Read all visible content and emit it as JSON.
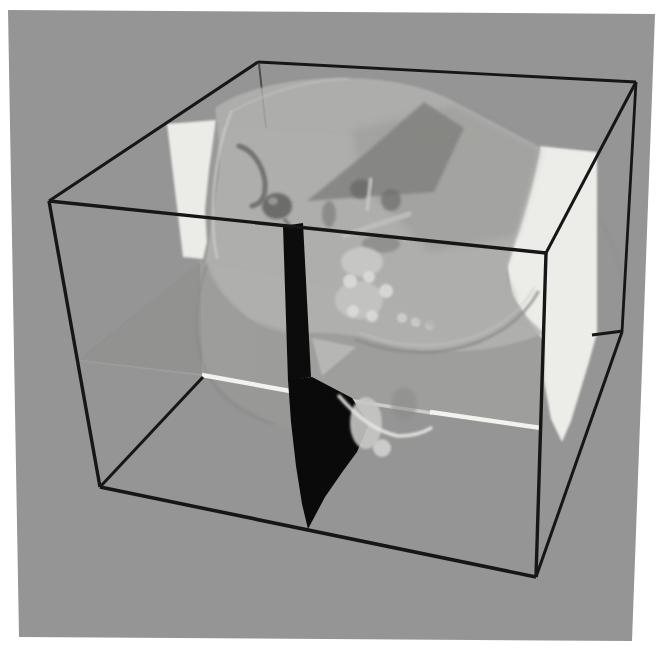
{
  "colors": {
    "page_bg": "#ffffff",
    "panel_bg": "#959595",
    "wireframe": "#161616",
    "sagittal_black": "#0b0b0b",
    "plane_white": "#efefeb",
    "axial_sliver": "#f5f5f1",
    "skull_light": "#b3b3b1"
  },
  "panel": {
    "points": "8,10 655,14 632,641 19,637"
  },
  "figure": {
    "width": 672,
    "height": 661,
    "filters": [
      {
        "id": "f1",
        "std": 0.8
      },
      {
        "id": "f2",
        "std": 1.8
      },
      {
        "id": "f3",
        "std": 3.5
      }
    ],
    "elements": [
      {
        "kind": "line",
        "name": "box-edge-back-left-occluded",
        "x1": 259,
        "y1": 64,
        "x2": 266,
        "y2": 128,
        "stroke": "#3f3f3d",
        "sw": 2,
        "op": 0.85
      },
      {
        "kind": "polygon",
        "name": "coronal-plane-backdrop-tint",
        "points": "170,122 596,150 596,332 546,330 200,261",
        "fill": "#ffffff",
        "op": 0.05,
        "blur": "f3"
      },
      {
        "kind": "line",
        "name": "coronal-plane-top-edge",
        "x1": 170,
        "y1": 121,
        "x2": 596,
        "y2": 150,
        "stroke": "#878785",
        "sw": 1.3,
        "op": 0.5
      },
      {
        "kind": "polygon",
        "name": "axial-plane-surface",
        "points": "79,361 202,376 540,428 546,331 200,261",
        "fill": "#9e9e9c",
        "op": 0.9
      },
      {
        "kind": "polygon",
        "name": "axial-plane-left-wing",
        "points": "80,360 200,263 202,374",
        "fill": "#888886",
        "op": 0.55
      },
      {
        "kind": "line",
        "name": "axial-plane-left-edge",
        "x1": 81,
        "y1": 359,
        "x2": 199,
        "y2": 263,
        "stroke": "#8a8a88",
        "sw": 1.4,
        "op": 0.55
      },
      {
        "kind": "polygon",
        "name": "coronal-plane-left-patch",
        "points": "167,124 216,120 209,170 205,210 207,242 203,259 183,257",
        "fill": "#eeeeea",
        "op": 0.97,
        "blur": "f1"
      },
      {
        "kind": "polygon",
        "name": "coronal-plane-right-patch",
        "points": "540,146 597,152 597,333 589,362 571,421 562,442 551,419 544,381 544,341 527,319 512,296 507,266 517,229 530,186",
        "fill": "#efefeb",
        "op": 0.97,
        "blur": "f1"
      },
      {
        "kind": "path",
        "name": "skull-back-silhouette",
        "d": "M600,218 Q618,250 626,292",
        "stroke": "#8a8a88",
        "sw": 2,
        "op": 0.35,
        "blur": "f2"
      },
      {
        "kind": "path",
        "name": "skull-dome",
        "d": "M215,108 C243,87 297,77 348,78 C398,79 431,89 455,102 L540,147 C535,183 522,224 508,266 C505,284 514,301 529,319 L544,333 C517,346 473,353 434,351 C401,350 379,343 361,337 C331,331 305,333 287,333 C261,330 239,314 223,295 C209,277 204,266 206,259 C210,235 215,203 219,173 C221,153 217,124 215,108 Z",
        "fill": "#b3b3b1",
        "op": 0.82,
        "blur": "f1"
      },
      {
        "kind": "polygon",
        "name": "skull-bowl-region",
        "points": "206,262 196,300 198,340 212,378 238,404 272,423 295,430 295,333 250,320 222,292",
        "fill": "#9b9b99",
        "op": 0.5,
        "blur": "f2"
      },
      {
        "kind": "path",
        "name": "skull-bowl-rim",
        "d": "M207,265 C194,300 193,340 206,372 C218,397 245,415 273,424",
        "stroke": "#848482",
        "sw": 2,
        "op": 0.5,
        "blur": "f1"
      },
      {
        "kind": "polygon",
        "name": "skull-inner-shade",
        "points": "352,130 455,106 540,150 516,235 430,252 362,182",
        "fill": "#9e9e9c",
        "op": 0.7,
        "blur": "f3"
      },
      {
        "kind": "polygon",
        "name": "sagittal-cut-wedge",
        "points": "424,102 464,128 434,192 307,201 366,153",
        "fill": "#7f7f7d",
        "op": 0.8,
        "blur": "f2"
      },
      {
        "kind": "path",
        "name": "left-temporal-arc",
        "d": "M239,146 C253,150 263,166 265,182 C266,196 261,204 252,206",
        "stroke": "#666664",
        "sw": 5,
        "op": 0.8,
        "blur": "f1"
      },
      {
        "kind": "ellipse",
        "name": "left-eye-socket",
        "cx": 277,
        "cy": 206,
        "rx": 15,
        "ry": 13,
        "fill": "#5c5c5a",
        "op": 0.8,
        "blur": "f2"
      },
      {
        "kind": "ellipse",
        "name": "left-eye-socket-inner",
        "cx": 273,
        "cy": 201,
        "rx": 5,
        "ry": 4,
        "fill": "#9a9a98",
        "op": 0.9,
        "blur": "f1"
      },
      {
        "kind": "path",
        "name": "orbit-hook",
        "d": "M285,220 Q292,228 294,236",
        "stroke": "#6a6a68",
        "sw": 4,
        "op": 0.7,
        "blur": "f1"
      },
      {
        "kind": "ellipse",
        "name": "nasal-cavity",
        "cx": 329,
        "cy": 214,
        "rx": 7,
        "ry": 13,
        "fill": "#7a7a78",
        "op": 0.65,
        "blur": "f2"
      },
      {
        "kind": "ellipse",
        "name": "right-eye-socket",
        "cx": 361,
        "cy": 189,
        "rx": 11,
        "ry": 10,
        "fill": "#6b6b69",
        "op": 0.8,
        "blur": "f2"
      },
      {
        "kind": "ellipse",
        "name": "right-orbit-recess",
        "cx": 391,
        "cy": 200,
        "rx": 10,
        "ry": 11,
        "fill": "#6f6f6d",
        "op": 0.75,
        "blur": "f2"
      },
      {
        "kind": "line",
        "name": "orbit-bright-streak",
        "x1": 371,
        "y1": 178,
        "x2": 367,
        "y2": 211,
        "stroke": "#c6c6c4",
        "sw": 4,
        "op": 0.85,
        "blur": "f1"
      },
      {
        "kind": "path",
        "name": "cheekbone-ridge",
        "d": "M344,236 Q378,224 409,214",
        "stroke": "#c0c0be",
        "sw": 5,
        "op": 0.85,
        "blur": "f1"
      },
      {
        "kind": "ellipse",
        "name": "under-cheek-shadow",
        "cx": 381,
        "cy": 244,
        "rx": 19,
        "ry": 9,
        "fill": "#7e7e7c",
        "op": 0.6,
        "blur": "f2"
      },
      {
        "kind": "ellipse",
        "name": "maxilla-mass",
        "cx": 362,
        "cy": 262,
        "rx": 21,
        "ry": 15,
        "fill": "#c9c9c7",
        "op": 0.9,
        "blur": "f2"
      },
      {
        "kind": "ellipse",
        "name": "mandible-mass",
        "cx": 359,
        "cy": 300,
        "rx": 24,
        "ry": 19,
        "fill": "#c5c5c3",
        "op": 0.9,
        "blur": "f2"
      },
      {
        "kind": "circle",
        "name": "tooth-knob-1",
        "cx": 350,
        "cy": 281,
        "r": 7,
        "fill": "#dbdbd9",
        "op": 0.9,
        "blur": "f1"
      },
      {
        "kind": "circle",
        "name": "tooth-knob-2",
        "cx": 369,
        "cy": 277,
        "r": 6,
        "fill": "#dbdbd9",
        "op": 0.9,
        "blur": "f1"
      },
      {
        "kind": "circle",
        "name": "tooth-knob-3",
        "cx": 386,
        "cy": 291,
        "r": 7,
        "fill": "#dbdbd9",
        "op": 0.9,
        "blur": "f1"
      },
      {
        "kind": "circle",
        "name": "tooth-knob-4",
        "cx": 353,
        "cy": 311,
        "r": 6,
        "fill": "#dbdbd9",
        "op": 0.9,
        "blur": "f1"
      },
      {
        "kind": "circle",
        "name": "tooth-knob-5",
        "cx": 372,
        "cy": 316,
        "r": 6,
        "fill": "#dbdbd9",
        "op": 0.9,
        "blur": "f1"
      },
      {
        "kind": "circle",
        "name": "molar-1",
        "cx": 402,
        "cy": 318,
        "r": 5,
        "fill": "#d4d4d2",
        "op": 0.8,
        "blur": "f1"
      },
      {
        "kind": "circle",
        "name": "molar-2",
        "cx": 416,
        "cy": 322,
        "r": 5,
        "fill": "#d4d4d2",
        "op": 0.8,
        "blur": "f1"
      },
      {
        "kind": "circle",
        "name": "molar-3",
        "cx": 430,
        "cy": 325,
        "r": 5,
        "fill": "#d4d4d2",
        "op": 0.8,
        "blur": "f1"
      },
      {
        "kind": "ellipse",
        "name": "jaw-mass",
        "cx": 462,
        "cy": 300,
        "rx": 52,
        "ry": 36,
        "fill": "#aeaeac",
        "op": 0.8,
        "blur": "f3"
      },
      {
        "kind": "path",
        "name": "jaw-arc-shadow",
        "d": "M356,340 Q420,364 478,342 Q520,325 538,292",
        "stroke": "#8b8b89",
        "sw": 3,
        "op": 0.75,
        "blur": "f1"
      },
      {
        "kind": "path",
        "name": "jaw-arc-highlight",
        "d": "M360,333 Q420,356 476,336 Q516,320 534,288",
        "stroke": "#c4c4c2",
        "sw": 2,
        "op": 0.55,
        "blur": "f1"
      },
      {
        "kind": "path",
        "name": "skull-rim-highlight-left",
        "d": "M217,258 C209,220 212,160 231,112",
        "stroke": "#cfcfcd",
        "sw": 2.5,
        "op": 0.75,
        "blur": "f1"
      },
      {
        "kind": "path",
        "name": "skull-rim-highlight-top",
        "d": "M231,112 Q290,80 348,79",
        "stroke": "#c6c6c4",
        "sw": 2,
        "op": 0.55,
        "blur": "f1"
      },
      {
        "kind": "line",
        "name": "axial-front-edge-sliver-left",
        "x1": 202,
        "y1": 375,
        "x2": 290,
        "y2": 391,
        "stroke": "#f5f5f1",
        "sw": 4.5,
        "op": 0.97
      },
      {
        "kind": "line",
        "name": "axial-front-edge-sliver-mid",
        "x1": 308,
        "y1": 394,
        "x2": 432,
        "y2": 413,
        "stroke": "#d9d9d5",
        "sw": 3.5,
        "op": 0.8
      },
      {
        "kind": "line",
        "name": "axial-front-edge-sliver-right",
        "x1": 430,
        "y1": 412,
        "x2": 541,
        "y2": 428,
        "stroke": "#f5f5f1",
        "sw": 4.5,
        "op": 0.97
      },
      {
        "kind": "polygon",
        "name": "sagittal-plane-upper",
        "points": "283,226 303,223 311,377 288,381",
        "fill": "#0c0c0c"
      },
      {
        "kind": "polygon",
        "name": "sagittal-plane-lower",
        "points": "288,380 312,377 352,398 369,424 357,452 343,471 325,497 308,529 302,504 296,466 291,422",
        "fill": "#0a0a0a"
      },
      {
        "kind": "polygon",
        "name": "mouth-cavity-patch",
        "points": "312,338 356,347 322,376",
        "fill": "#bbbbb9",
        "op": 0.85,
        "blur": "f1"
      },
      {
        "kind": "ellipse",
        "name": "lip-bone-bump",
        "cx": 366,
        "cy": 423,
        "rx": 16,
        "ry": 26,
        "fill": "#c7c7c5",
        "op": 0.9,
        "blur": "f1"
      },
      {
        "kind": "circle",
        "name": "lip-bone-knob",
        "cx": 382,
        "cy": 448,
        "r": 9,
        "fill": "#d1d1cf",
        "op": 0.9,
        "blur": "f1"
      },
      {
        "kind": "path",
        "name": "chin-profile-highlight",
        "d": "M339,396 Q368,430 398,436 Q418,436 431,428",
        "stroke": "#e6e6e2",
        "sw": 3.5,
        "op": 0.9,
        "blur": "f1"
      },
      {
        "kind": "ellipse",
        "name": "chin-shadow",
        "cx": 404,
        "cy": 404,
        "rx": 13,
        "ry": 17,
        "fill": "#8a8a88",
        "op": 0.5,
        "blur": "f2"
      },
      {
        "kind": "line",
        "name": "box-edge-back-top",
        "x1": 258,
        "y1": 62,
        "x2": 636,
        "y2": 82,
        "stroke": "#161616",
        "sw": 2.8
      },
      {
        "kind": "line",
        "name": "box-edge-back-right",
        "x1": 636,
        "y1": 82,
        "x2": 622,
        "y2": 332,
        "stroke": "#161616",
        "sw": 2.8
      },
      {
        "kind": "line",
        "name": "box-edge-back-bottom-stub",
        "x1": 592,
        "y1": 335,
        "x2": 623,
        "y2": 331,
        "stroke": "#161616",
        "sw": 2.8
      },
      {
        "kind": "line",
        "name": "box-edge-bottom-right",
        "x1": 622,
        "y1": 332,
        "x2": 536,
        "y2": 577,
        "stroke": "#161616",
        "sw": 3
      },
      {
        "kind": "line",
        "name": "box-edge-bottom-left-visible",
        "x1": 100,
        "y1": 487,
        "x2": 203,
        "y2": 377,
        "stroke": "#161616",
        "sw": 3
      },
      {
        "kind": "line",
        "name": "box-edge-left-top",
        "x1": 49,
        "y1": 201,
        "x2": 258,
        "y2": 62,
        "stroke": "#161616",
        "sw": 3
      },
      {
        "kind": "line",
        "name": "box-edge-top-right",
        "x1": 546,
        "y1": 253,
        "x2": 636,
        "y2": 82,
        "stroke": "#161616",
        "sw": 3
      },
      {
        "kind": "line",
        "name": "box-edge-front-top",
        "x1": 49,
        "y1": 201,
        "x2": 546,
        "y2": 253,
        "stroke": "#161616",
        "sw": 3.4
      },
      {
        "kind": "line",
        "name": "box-edge-front-left",
        "x1": 49,
        "y1": 201,
        "x2": 100,
        "y2": 487,
        "stroke": "#161616",
        "sw": 3.4
      },
      {
        "kind": "line",
        "name": "box-edge-front-right",
        "x1": 546,
        "y1": 253,
        "x2": 536,
        "y2": 577,
        "stroke": "#161616",
        "sw": 3.4
      },
      {
        "kind": "line",
        "name": "box-edge-front-bottom",
        "x1": 100,
        "y1": 487,
        "x2": 536,
        "y2": 577,
        "stroke": "#161616",
        "sw": 3.6
      }
    ]
  }
}
